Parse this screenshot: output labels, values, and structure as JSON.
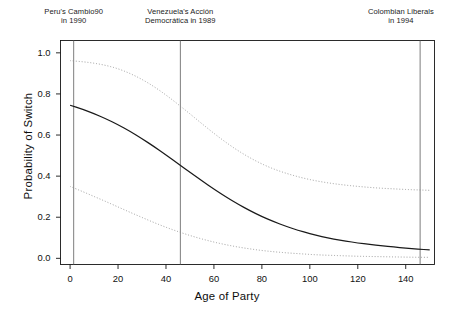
{
  "chart_data": {
    "type": "line",
    "title": "",
    "xlabel": "Age of Party",
    "ylabel": "Probability of Switch",
    "xlim": [
      -4,
      152
    ],
    "ylim": [
      -0.03,
      1.06
    ],
    "grid": false,
    "legend": "none",
    "xticks": [
      0,
      20,
      40,
      60,
      80,
      100,
      120,
      140
    ],
    "xtick_labels": [
      "0",
      "20",
      "40",
      "60",
      "80",
      "100",
      "120",
      "140"
    ],
    "yticks": [
      0.0,
      0.2,
      0.4,
      0.6,
      0.8,
      1.0
    ],
    "ytick_labels": [
      "0.0",
      "0.2",
      "0.4",
      "0.6",
      "0.8",
      "1.0"
    ],
    "series": [
      {
        "name": "Predicted probability",
        "style": "solid",
        "color": "#1a1a1a",
        "x": [
          0,
          5,
          10,
          15,
          20,
          25,
          30,
          35,
          40,
          45,
          50,
          55,
          60,
          65,
          70,
          75,
          80,
          85,
          90,
          95,
          100,
          105,
          110,
          115,
          120,
          125,
          130,
          135,
          140,
          145,
          150
        ],
        "values": [
          0.745,
          0.726,
          0.704,
          0.679,
          0.65,
          0.618,
          0.582,
          0.544,
          0.503,
          0.461,
          0.419,
          0.377,
          0.337,
          0.299,
          0.264,
          0.232,
          0.203,
          0.178,
          0.156,
          0.137,
          0.12,
          0.106,
          0.094,
          0.084,
          0.075,
          0.067,
          0.061,
          0.055,
          0.05,
          0.045,
          0.041
        ]
      },
      {
        "name": "Upper confidence bound",
        "style": "dotted",
        "color": "#8c8c8c",
        "x": [
          0,
          5,
          10,
          15,
          20,
          25,
          30,
          35,
          40,
          45,
          50,
          55,
          60,
          65,
          70,
          75,
          80,
          85,
          90,
          95,
          100,
          105,
          110,
          115,
          120,
          125,
          130,
          135,
          140,
          145,
          150
        ],
        "values": [
          0.962,
          0.957,
          0.95,
          0.939,
          0.923,
          0.9,
          0.871,
          0.836,
          0.795,
          0.75,
          0.703,
          0.655,
          0.608,
          0.564,
          0.524,
          0.489,
          0.459,
          0.434,
          0.414,
          0.397,
          0.383,
          0.372,
          0.363,
          0.356,
          0.35,
          0.345,
          0.341,
          0.338,
          0.335,
          0.333,
          0.331
        ]
      },
      {
        "name": "Lower confidence bound",
        "style": "dotted",
        "color": "#8c8c8c",
        "x": [
          0,
          5,
          10,
          15,
          20,
          25,
          30,
          35,
          40,
          45,
          50,
          55,
          60,
          65,
          70,
          75,
          80,
          85,
          90,
          95,
          100,
          105,
          110,
          115,
          120,
          125,
          130,
          135,
          140,
          145,
          150
        ],
        "values": [
          0.35,
          0.326,
          0.301,
          0.276,
          0.25,
          0.224,
          0.199,
          0.174,
          0.151,
          0.13,
          0.111,
          0.094,
          0.079,
          0.066,
          0.055,
          0.046,
          0.038,
          0.032,
          0.027,
          0.023,
          0.019,
          0.016,
          0.014,
          0.012,
          0.01,
          0.009,
          0.008,
          0.007,
          0.006,
          0.005,
          0.005
        ]
      }
    ],
    "annotations": [
      {
        "id": "peru",
        "line1": "Peru's Cambio90",
        "line2": "in 1990",
        "x_value": 1.5,
        "rule": "vertical"
      },
      {
        "id": "venezuela",
        "line1": "Venezuela's Acción",
        "line2": "Democrática in 1989",
        "x_value": 46,
        "rule": "vertical"
      },
      {
        "id": "colombia",
        "line1": "Colombian Liberals",
        "line2": "in 1994",
        "x_value": 146,
        "rule": "vertical"
      }
    ]
  }
}
